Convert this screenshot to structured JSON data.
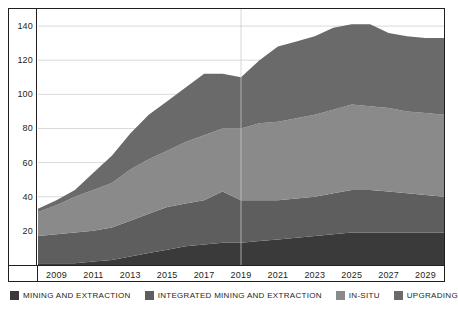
{
  "chart_data": {
    "type": "area",
    "stacked": true,
    "title": "",
    "subtitle": "",
    "xlabel": "",
    "ylabel": "",
    "ylim": [
      0,
      150
    ],
    "yticks": [
      20,
      40,
      60,
      80,
      100,
      120,
      140
    ],
    "ytick_labels": [
      "20",
      "40",
      "60",
      "80",
      "100",
      "120",
      "140"
    ],
    "grid": true,
    "grid_axis": "y",
    "legend_position": "bottom",
    "x": [
      2008,
      2009,
      2010,
      2011,
      2012,
      2013,
      2014,
      2015,
      2016,
      2017,
      2018,
      2019,
      2020,
      2021,
      2022,
      2023,
      2024,
      2025,
      2026,
      2027,
      2028,
      2029,
      2030
    ],
    "xtick_labels": [
      "2009",
      "2011",
      "2013",
      "2015",
      "2017",
      "2019",
      "2021",
      "2023",
      "2025",
      "2027",
      "2029"
    ],
    "xticks": [
      2009,
      2011,
      2013,
      2015,
      2017,
      2019,
      2021,
      2023,
      2025,
      2027,
      2029
    ],
    "series": [
      {
        "name": "MINING AND EXTRACTION",
        "color": "#3a3a3a",
        "values": [
          1,
          1,
          1,
          2,
          3,
          5,
          7,
          9,
          11,
          12,
          13,
          13,
          14,
          15,
          16,
          17,
          18,
          19,
          19,
          19,
          19,
          19,
          19
        ]
      },
      {
        "name": "INTEGRATED MINING AND EXTRACTION",
        "color": "#5e5e5e",
        "values": [
          16,
          17,
          18,
          18,
          19,
          21,
          23,
          25,
          25,
          26,
          30,
          25,
          24,
          23,
          23,
          23,
          24,
          25,
          25,
          24,
          23,
          22,
          21
        ]
      },
      {
        "name": "IN-SITU",
        "color": "#8a8a8a",
        "values": [
          14,
          17,
          21,
          24,
          26,
          30,
          32,
          33,
          36,
          38,
          37,
          42,
          45,
          46,
          47,
          48,
          49,
          50,
          49,
          49,
          48,
          48,
          48
        ]
      },
      {
        "name": "UPGRADING",
        "color": "#6a6a6a",
        "values": [
          2,
          3,
          4,
          10,
          16,
          21,
          26,
          29,
          32,
          36,
          32,
          30,
          37,
          44,
          45,
          46,
          48,
          47,
          48,
          44,
          44,
          44,
          45
        ]
      }
    ],
    "totals": [
      33,
      38,
      44,
      54,
      64,
      77,
      88,
      96,
      104,
      112,
      112,
      110,
      120,
      128,
      131,
      134,
      139,
      141,
      141,
      136,
      134,
      133,
      133
    ],
    "reference_line_x": 2019
  },
  "legend": {
    "items": [
      {
        "label": "MINING AND EXTRACTION",
        "color": "#3a3a3a"
      },
      {
        "label": "INTEGRATED MINING AND EXTRACTION",
        "color": "#5e5e5e"
      },
      {
        "label": "IN-SITU",
        "color": "#8a8a8a"
      },
      {
        "label": "UPGRADING",
        "color": "#6a6a6a"
      }
    ]
  },
  "style": {
    "frame_color": "#231f20",
    "grid_color": "#d9d9d9",
    "background": "#ffffff",
    "text_color": "#231f20"
  }
}
